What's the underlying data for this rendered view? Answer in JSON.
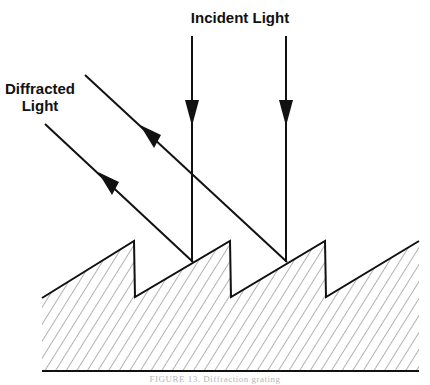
{
  "labels": {
    "incident": "Incident Light",
    "diffracted_line1": "Diffracted",
    "diffracted_line2": "Light"
  },
  "caption": "FIGURE 13. Diffraction grating",
  "colors": {
    "line": "#111111",
    "hatch": "#555555",
    "caption": "#b5b5b5",
    "background": "#ffffff"
  },
  "geometry": {
    "grating_profile": [
      [
        42,
        298
      ],
      [
        134,
        241
      ],
      [
        135,
        297
      ],
      [
        230,
        241
      ],
      [
        231,
        297
      ],
      [
        325,
        241
      ],
      [
        326,
        297
      ],
      [
        419,
        241
      ]
    ],
    "baseline": {
      "x1": 42,
      "y1": 371,
      "x2": 419,
      "y2": 371
    },
    "incident_rays": [
      {
        "x1": 192,
        "y1": 36,
        "x2": 192,
        "y2": 262
      },
      {
        "x1": 286,
        "y1": 36,
        "x2": 286,
        "y2": 262
      }
    ],
    "diffracted_rays": [
      {
        "x1": 193,
        "y1": 262,
        "x2": 45,
        "y2": 124
      },
      {
        "x1": 287,
        "y1": 262,
        "x2": 85,
        "y2": 75
      }
    ]
  }
}
